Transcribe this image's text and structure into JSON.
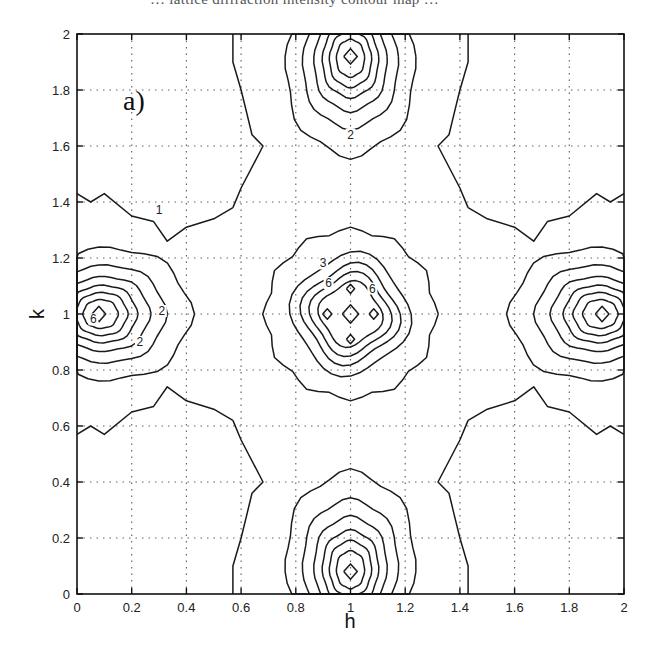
{
  "caption_fragment": "… lattice diffraction intensity contour map …",
  "chart_data": {
    "type": "contour",
    "panel_label": "a)",
    "title": "",
    "xlabel": "h",
    "ylabel": "k",
    "xlim": [
      0,
      2
    ],
    "ylim": [
      0,
      2
    ],
    "xticks": [
      "0",
      "0.2",
      "0.4",
      "0.6",
      "0.8",
      "1",
      "1.2",
      "1.4",
      "1.6",
      "1.8",
      "2"
    ],
    "yticks": [
      "0",
      "0.2",
      "0.4",
      "0.6",
      "0.8",
      "1",
      "1.2",
      "1.4",
      "1.6",
      "1.8",
      "2"
    ],
    "grid": "dotted",
    "contour_labels": [
      {
        "text": "2",
        "h": 1.0,
        "k": 1.63
      },
      {
        "text": "1",
        "h": 0.3,
        "k": 1.36
      },
      {
        "text": "3",
        "h": 0.9,
        "k": 1.17
      },
      {
        "text": "6",
        "h": 0.92,
        "k": 1.1
      },
      {
        "text": "6",
        "h": 1.08,
        "k": 1.08
      },
      {
        "text": "6",
        "h": 0.06,
        "k": 0.97
      },
      {
        "text": "2",
        "h": 0.31,
        "k": 1.0
      },
      {
        "text": "2",
        "h": 0.23,
        "k": 0.89
      }
    ],
    "peaks": [
      {
        "h": 1.0,
        "k": 1.0,
        "description": "central maximum with four satellite minima"
      },
      {
        "h": 1.0,
        "k": 1.92
      },
      {
        "h": 1.0,
        "k": 0.08
      },
      {
        "h": 0.08,
        "k": 1.0
      },
      {
        "h": 1.92,
        "k": 1.0
      }
    ],
    "contours": [
      {
        "level": 1,
        "points": [
          [
            0,
            1.43
          ],
          [
            0.05,
            1.4
          ],
          [
            0.1,
            1.43
          ],
          [
            0.2,
            1.35
          ],
          [
            0.28,
            1.33
          ],
          [
            0.33,
            1.26
          ],
          [
            0.4,
            1.31
          ],
          [
            0.5,
            1.34
          ],
          [
            0.57,
            1.38
          ]
        ]
      },
      {
        "level": 1,
        "points": [
          [
            0.57,
            1.38
          ],
          [
            0.6,
            1.45
          ],
          [
            0.68,
            1.6
          ],
          [
            0.64,
            1.64
          ],
          [
            0.62,
            1.72
          ],
          [
            0.6,
            1.8
          ],
          [
            0.57,
            1.9
          ],
          [
            0.57,
            2.0
          ]
        ]
      },
      {
        "level": 1,
        "points": [
          [
            1.43,
            2.0
          ],
          [
            1.43,
            1.9
          ],
          [
            1.4,
            1.8
          ],
          [
            1.38,
            1.72
          ],
          [
            1.36,
            1.64
          ],
          [
            1.32,
            1.6
          ],
          [
            1.4,
            1.45
          ],
          [
            1.43,
            1.38
          ]
        ]
      },
      {
        "level": 1,
        "points": [
          [
            1.43,
            1.38
          ],
          [
            1.5,
            1.34
          ],
          [
            1.6,
            1.31
          ],
          [
            1.67,
            1.26
          ],
          [
            1.72,
            1.33
          ],
          [
            1.8,
            1.35
          ],
          [
            1.9,
            1.43
          ],
          [
            1.95,
            1.4
          ],
          [
            2.0,
            1.43
          ]
        ]
      },
      {
        "level": 1,
        "points": [
          [
            0,
            0.57
          ],
          [
            0.05,
            0.6
          ],
          [
            0.1,
            0.57
          ],
          [
            0.2,
            0.65
          ],
          [
            0.28,
            0.67
          ],
          [
            0.33,
            0.74
          ],
          [
            0.4,
            0.69
          ],
          [
            0.5,
            0.66
          ],
          [
            0.57,
            0.62
          ]
        ]
      },
      {
        "level": 1,
        "points": [
          [
            0.57,
            0.62
          ],
          [
            0.6,
            0.55
          ],
          [
            0.68,
            0.4
          ],
          [
            0.64,
            0.36
          ],
          [
            0.62,
            0.28
          ],
          [
            0.6,
            0.2
          ],
          [
            0.57,
            0.1
          ],
          [
            0.57,
            0.0
          ]
        ]
      },
      {
        "level": 1,
        "points": [
          [
            1.43,
            0.0
          ],
          [
            1.43,
            0.1
          ],
          [
            1.4,
            0.2
          ],
          [
            1.38,
            0.28
          ],
          [
            1.36,
            0.36
          ],
          [
            1.32,
            0.4
          ],
          [
            1.4,
            0.55
          ],
          [
            1.43,
            0.62
          ]
        ]
      },
      {
        "level": 1,
        "points": [
          [
            1.43,
            0.62
          ],
          [
            1.5,
            0.66
          ],
          [
            1.6,
            0.69
          ],
          [
            1.67,
            0.74
          ],
          [
            1.72,
            0.67
          ],
          [
            1.8,
            0.65
          ],
          [
            1.9,
            0.57
          ],
          [
            1.95,
            0.6
          ],
          [
            2.0,
            0.57
          ]
        ]
      }
    ]
  }
}
